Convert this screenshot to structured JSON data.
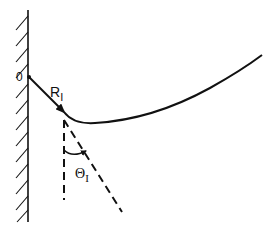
{
  "diagram": {
    "origin_label": "0",
    "radius_label": {
      "main": "R",
      "subscript": "I"
    },
    "angle_label": {
      "main": "Θ",
      "subscript": "I"
    },
    "colors": {
      "stroke": "#111111",
      "background": "#ffffff"
    },
    "elements": [
      "wall-with-hatching",
      "trajectory-curve",
      "radius-arrow",
      "vertical-dashed-line",
      "tangent-dashed-line",
      "angle-arc"
    ]
  }
}
